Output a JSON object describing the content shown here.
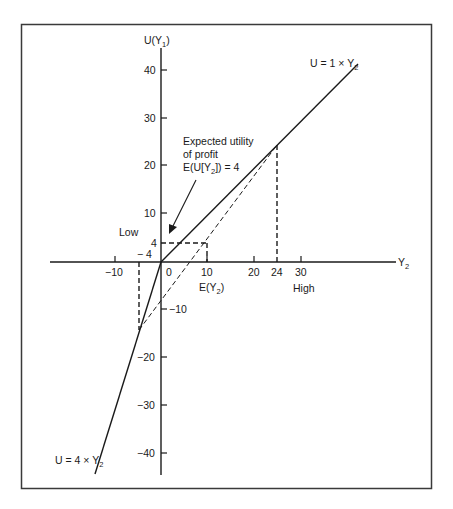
{
  "figure": {
    "type": "utility-function-diagram",
    "y_axis": {
      "label_main": "U(Y",
      "label_sub": "1",
      "label_close": ")",
      "ticks": [
        "40",
        "30",
        "20",
        "10",
        "−10",
        "−20",
        "−30",
        "−40"
      ]
    },
    "x_axis": {
      "label_main": "Y",
      "label_sub": "2",
      "ticks": [
        "−10",
        "0",
        "10",
        "20",
        "24",
        "30"
      ]
    },
    "lines": {
      "upper_label_main": "U = 1 × Y",
      "upper_label_sub": "2",
      "lower_label_main": "U = 4 × Y",
      "lower_label_sub": "2"
    },
    "annotations": {
      "expected_utility_line1": "Expected utility",
      "expected_utility_line2": "of profit",
      "expected_utility_line3_main": "E(U[Y",
      "expected_utility_line3_sub": "2",
      "expected_utility_line3_close": "]) = 4",
      "low_label": "Low",
      "high_label": "High",
      "four_label": "4",
      "minus_four_label": "− 4",
      "ey_label_main": "E(Y",
      "ey_label_sub": "2",
      "ey_label_close": ")"
    },
    "key_points": {
      "low_outcome": {
        "Y2": -4,
        "U": -16
      },
      "high_outcome": {
        "Y2": 24,
        "U": 24
      },
      "expected_value": {
        "Y2": 10,
        "U": 4
      }
    },
    "colors": {
      "ink": "#1a1a1a",
      "frame": "#3a3a3a",
      "background": "#ffffff"
    }
  }
}
